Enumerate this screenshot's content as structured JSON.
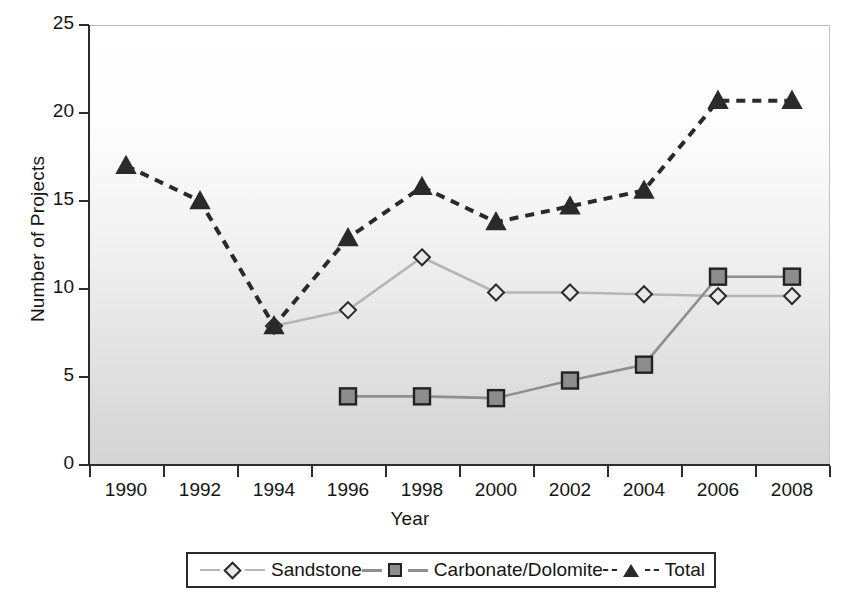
{
  "chart_data": {
    "type": "line",
    "title": "",
    "xlabel": "Year",
    "ylabel": "Number of Projects",
    "categories": [
      "1990",
      "1992",
      "1994",
      "1996",
      "1998",
      "2000",
      "2002",
      "2004",
      "2006",
      "2008"
    ],
    "ylim": [
      0,
      25
    ],
    "yticks": [
      0,
      5,
      10,
      15,
      20,
      25
    ],
    "grid": false,
    "legend_position": "bottom",
    "series": [
      {
        "name": "Sandstone",
        "marker": "diamond",
        "color": "#b5b5b5",
        "marker_fill": "#e9e9e9",
        "marker_edge": "#2a2a2a",
        "line_style": "solid",
        "values": [
          null,
          null,
          7.9,
          8.8,
          11.8,
          9.8,
          9.8,
          9.7,
          9.6,
          9.6
        ]
      },
      {
        "name": "Carbonate/Dolomite",
        "marker": "square",
        "color": "#8f8f8f",
        "marker_fill": "#8d8d8d",
        "marker_edge": "#222222",
        "line_style": "solid",
        "values": [
          null,
          null,
          null,
          3.9,
          3.9,
          3.8,
          4.8,
          5.7,
          10.7,
          10.7
        ]
      },
      {
        "name": "Total",
        "marker": "triangle",
        "color": "#2a2a2a",
        "marker_fill": "#2a2a2a",
        "marker_edge": "#2a2a2a",
        "line_style": "dashed",
        "values": [
          17.0,
          15.0,
          7.9,
          12.9,
          15.8,
          13.8,
          14.7,
          15.6,
          20.7,
          20.7
        ]
      }
    ]
  },
  "axes": {
    "y_title": "Number of Projects",
    "x_title": "Year",
    "y_tick_labels": [
      "25",
      "20",
      "15",
      "10",
      "5",
      "0"
    ],
    "x_tick_labels": [
      "1990",
      "1992",
      "1994",
      "1996",
      "1998",
      "2000",
      "2002",
      "2004",
      "2006",
      "2008"
    ]
  },
  "legend": {
    "items": [
      {
        "label": "Sandstone",
        "marker": "diamond-marker"
      },
      {
        "label": "Carbonate/Dolomite",
        "marker": "square-marker"
      },
      {
        "label": "Total",
        "marker": "triangle-marker"
      }
    ]
  }
}
